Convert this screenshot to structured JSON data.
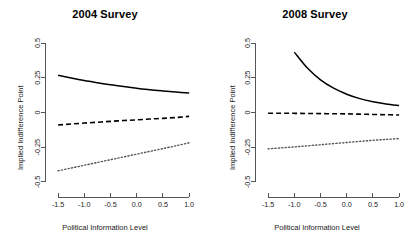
{
  "figure": {
    "background": "#ffffff",
    "line_color": "#000000",
    "axis_color": "#555555"
  },
  "chart_data": [
    {
      "type": "line",
      "title": "2004 Survey",
      "xlabel": "Political Information Level",
      "ylabel": "Implied Indifference Point",
      "xlim": [
        -1.75,
        1.15
      ],
      "ylim": [
        -0.58,
        0.58
      ],
      "xticks": [
        -1.5,
        -1.0,
        -0.5,
        0.0,
        0.5,
        1.0
      ],
      "xticklabels": [
        "-1.5",
        "-1.0",
        "-0.5",
        "0.0",
        "0.5",
        "1.0"
      ],
      "yticks": [
        -0.5,
        -0.25,
        0.0,
        0.25,
        0.5
      ],
      "yticklabels": [
        "-0.5",
        "-0.25",
        "0",
        "0.25",
        "0.5"
      ],
      "grid": false,
      "legend": "none",
      "x": [
        -1.5,
        -1.25,
        -1.0,
        -0.75,
        -0.5,
        -0.25,
        0.0,
        0.25,
        0.5,
        0.75,
        1.0
      ],
      "series": [
        {
          "name": "upper-bound-estimate",
          "style": "solid",
          "values": [
            0.268,
            0.249,
            0.231,
            0.215,
            0.2,
            0.187,
            0.175,
            0.164,
            0.155,
            0.147,
            0.14
          ]
        },
        {
          "name": "point-estimate",
          "style": "dashed",
          "values": [
            -0.09,
            -0.083,
            -0.076,
            -0.07,
            -0.064,
            -0.058,
            -0.053,
            -0.047,
            -0.042,
            -0.036,
            -0.028
          ]
        },
        {
          "name": "lower-bound-estimate",
          "style": "dotted",
          "values": [
            -0.42,
            -0.4,
            -0.38,
            -0.36,
            -0.34,
            -0.32,
            -0.3,
            -0.28,
            -0.26,
            -0.24,
            -0.218
          ]
        }
      ]
    },
    {
      "type": "line",
      "title": "2008 Survey",
      "xlabel": "Political Information Level",
      "ylabel": "Implied Indifference Point",
      "xlim": [
        -1.75,
        1.15
      ],
      "ylim": [
        -0.58,
        0.58
      ],
      "xticks": [
        -1.5,
        -1.0,
        -0.5,
        0.0,
        0.5,
        1.0
      ],
      "xticklabels": [
        "-1.5",
        "-1.0",
        "-0.5",
        "0.0",
        "0.5",
        "1.0"
      ],
      "yticks": [
        -0.5,
        -0.25,
        0.0,
        0.25,
        0.5
      ],
      "yticklabels": [
        "-0.5",
        "-0.25",
        "0",
        "0.25",
        "0.5"
      ],
      "grid": false,
      "legend": "none",
      "x": [
        -1.5,
        -1.25,
        -1.0,
        -0.75,
        -0.5,
        -0.25,
        0.0,
        0.25,
        0.5,
        0.75,
        1.0
      ],
      "series": [
        {
          "name": "upper-bound-estimate",
          "style": "solid",
          "values": [
            null,
            null,
            0.435,
            0.32,
            0.235,
            0.175,
            0.132,
            0.1,
            0.078,
            0.062,
            0.05
          ]
        },
        {
          "name": "point-estimate",
          "style": "dashed",
          "values": [
            -0.005,
            -0.005,
            -0.006,
            -0.007,
            -0.008,
            -0.009,
            -0.01,
            -0.012,
            -0.014,
            -0.016,
            -0.018
          ]
        },
        {
          "name": "lower-bound-estimate",
          "style": "dotted",
          "values": [
            -0.262,
            -0.255,
            -0.248,
            -0.24,
            -0.232,
            -0.224,
            -0.216,
            -0.208,
            -0.2,
            -0.194,
            -0.188
          ]
        }
      ]
    }
  ]
}
